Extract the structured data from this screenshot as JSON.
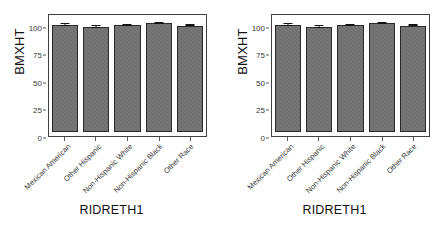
{
  "figure": {
    "background_color": "#ffffff",
    "bar_color": "#6f6f6f",
    "bar_border_color": "#2a2a2a",
    "panel_border_color": "#3f3f3f",
    "axis_text_color": "#3a3a3a"
  },
  "panels": [
    {
      "id": "left-panel"
    },
    {
      "id": "right-panel"
    }
  ],
  "chart_data": [
    {
      "type": "bar",
      "title": "",
      "xlabel": "RIDRETH1",
      "ylabel": "BMXHT",
      "ylim": [
        0,
        105
      ],
      "yticks": [
        0,
        25,
        50,
        75,
        100
      ],
      "ytick_labels": [
        "0",
        "25",
        "50",
        "75",
        "100"
      ],
      "grid": false,
      "legend": "none",
      "categories": [
        "Mexican American",
        "Other Hispanic",
        "Non-Hispanic White",
        "Non-Hispanic Black",
        "Other Race"
      ],
      "values": [
        99.4,
        97.5,
        99.2,
        101.0,
        98.9
      ],
      "errors": [
        0.6,
        0.8,
        0.5,
        0.7,
        0.7
      ]
    },
    {
      "type": "bar",
      "title": "",
      "xlabel": "RIDRETH1",
      "ylabel": "BMXHT",
      "ylim": [
        0,
        105
      ],
      "yticks": [
        0,
        25,
        50,
        75,
        100
      ],
      "ytick_labels": [
        "0",
        "25",
        "50",
        "75",
        "100"
      ],
      "grid": false,
      "legend": "none",
      "categories": [
        "Mexican American",
        "Other Hispanic",
        "Non-Hispanic White",
        "Non-Hispanic Black",
        "Other Race"
      ],
      "values": [
        99.4,
        97.5,
        99.2,
        101.0,
        98.9
      ],
      "errors": [
        0.6,
        0.8,
        0.5,
        0.7,
        0.7
      ]
    }
  ]
}
